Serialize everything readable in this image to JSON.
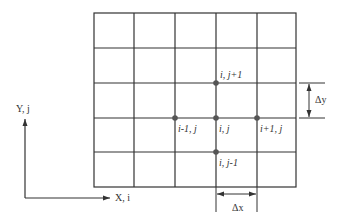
{
  "diagram": {
    "colors": {
      "line": "#333333",
      "node": "#555555",
      "background": "#ffffff"
    },
    "grid": {
      "columns": 5,
      "rows": 5
    },
    "nodes": {
      "center": "i, j",
      "top": "i, j+1",
      "bottom": "i, j-1",
      "left": "i-1, j",
      "right": "i+1, j"
    },
    "axes": {
      "y_label": "Y, j",
      "x_label": "X, i"
    },
    "dimensions": {
      "dy_label": "Δy",
      "dx_label": "Δx"
    }
  }
}
